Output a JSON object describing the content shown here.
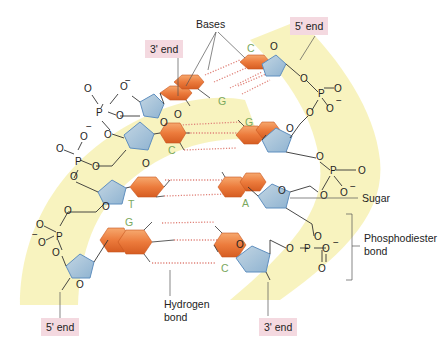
{
  "diagram": {
    "type": "dna-double-helix-segment",
    "labels": {
      "bases": "Bases",
      "sugar": "Sugar",
      "phosphodiester_line1": "Phosphodiester",
      "phosphodiester_line2": "bond",
      "hydrogen_line1": "Hydrogen",
      "hydrogen_line2": "bond"
    },
    "ends": {
      "top_left": "3' end",
      "top_right": "5' end",
      "bottom_left": "5' end",
      "bottom_right": "3' end"
    },
    "base_pairs": [
      {
        "left": "G",
        "right": "C"
      },
      {
        "left": "C",
        "right": "G"
      },
      {
        "left": "T",
        "right": "A"
      },
      {
        "left": "G",
        "right": "C"
      }
    ],
    "colors": {
      "backbone_band": "#f7f2b8",
      "sugar": "#a9c6dc",
      "sugar_edge": "#5f8fbf",
      "base": "#ec7b3c",
      "base_light": "#f4a26a",
      "hbond": "#e0837a",
      "base_letter": "#7aa85e",
      "end_box": "#f4d9e0"
    }
  }
}
